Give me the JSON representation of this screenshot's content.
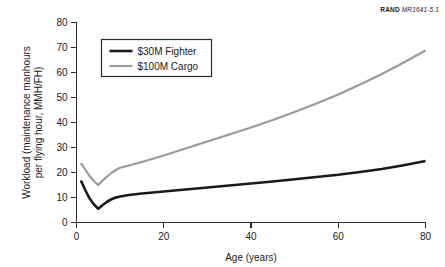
{
  "figure_id": {
    "org": "RAND",
    "number": "MR1641-5.1"
  },
  "chart_data": {
    "type": "line",
    "title": "",
    "xlabel": "Age (years)",
    "ylabel": "Workload (maintenance manhours per flying hour, MMH/FH)",
    "ylabel_lines": [
      "Workload (maintenance manhours",
      "per flying hour, MMH/FH)"
    ],
    "xlim": [
      0,
      80
    ],
    "ylim": [
      0,
      80
    ],
    "xticks": [
      0,
      20,
      40,
      60,
      80
    ],
    "yticks": [
      0,
      10,
      20,
      30,
      40,
      50,
      60,
      70,
      80
    ],
    "xtick_labels": [
      "0",
      "20",
      "40",
      "60",
      "80"
    ],
    "ytick_labels": [
      "0",
      "10",
      "20",
      "30",
      "40",
      "50",
      "60",
      "70",
      "80"
    ],
    "grid": false,
    "legend_position": "upper-left-inside",
    "series": [
      {
        "name": "$30M Fighter",
        "color": "#1a1a1a",
        "width": 2.6,
        "x": [
          1,
          2,
          3,
          4,
          5,
          6,
          7,
          8,
          9,
          10,
          12,
          15,
          20,
          25,
          30,
          35,
          40,
          45,
          50,
          55,
          60,
          65,
          70,
          75,
          80
        ],
        "y": [
          16.8,
          13.0,
          9.6,
          7.2,
          5.5,
          7.0,
          8.3,
          9.3,
          10.0,
          10.4,
          11.0,
          11.6,
          12.4,
          13.2,
          14.0,
          14.8,
          15.6,
          16.4,
          17.3,
          18.2,
          19.1,
          20.2,
          21.4,
          22.9,
          24.6
        ]
      },
      {
        "name": "$100M Cargo",
        "color": "#9a9a9a",
        "width": 2.2,
        "x": [
          1,
          2,
          3,
          4,
          5,
          6,
          7,
          8,
          9,
          10,
          12,
          15,
          20,
          25,
          30,
          35,
          40,
          45,
          50,
          55,
          60,
          65,
          70,
          75,
          80
        ],
        "y": [
          23.8,
          21.2,
          18.6,
          16.5,
          15.0,
          16.8,
          18.4,
          19.8,
          21.0,
          21.9,
          22.8,
          24.2,
          26.8,
          29.6,
          32.4,
          35.2,
          38.0,
          41.0,
          44.2,
          47.6,
          51.2,
          55.2,
          59.4,
          64.0,
          68.8
        ]
      }
    ],
    "legend": [
      {
        "label": "$30M Fighter",
        "color": "#1a1a1a",
        "width": 2.6
      },
      {
        "label": "$100M Cargo",
        "color": "#9a9a9a",
        "width": 2.2
      }
    ]
  }
}
